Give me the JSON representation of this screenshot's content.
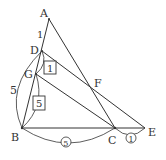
{
  "diagram": {
    "points": {
      "A": {
        "label": "A",
        "x": 49,
        "y": 19
      },
      "D": {
        "label": "D",
        "x": 42,
        "y": 51
      },
      "G": {
        "label": "G",
        "x": 36,
        "y": 74
      },
      "B": {
        "label": "B",
        "x": 22,
        "y": 128
      },
      "C": {
        "label": "C",
        "x": 115,
        "y": 128
      },
      "E": {
        "label": "E",
        "x": 145,
        "y": 128
      },
      "F": {
        "label": "F",
        "x": 92,
        "y": 90
      }
    },
    "segment_labels": {
      "AD": "1",
      "BD": "5",
      "DG_boxed": "1",
      "GB_boxed": "5",
      "BC_circled": "5",
      "CE_circled": "1"
    },
    "colors": {
      "stroke": "#333333",
      "background": "#ffffff"
    }
  }
}
